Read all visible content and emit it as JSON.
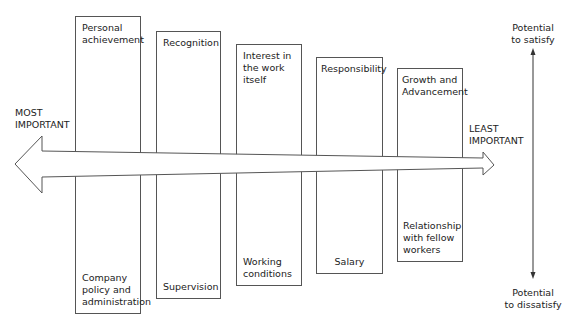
{
  "diagram": {
    "horizontal_axis": {
      "left_label": [
        "MOST",
        "IMPORTANT"
      ],
      "right_label": [
        "LEAST",
        "IMPORTANT"
      ]
    },
    "vertical_axis": {
      "top_label": [
        "Potential",
        "to satisfy"
      ],
      "bottom_label": [
        "Potential",
        "to dissatisfy"
      ]
    },
    "factors": [
      {
        "motivator": [
          "Personal",
          "achievement"
        ],
        "hygiene": [
          "Company",
          "policy and",
          "administration"
        ]
      },
      {
        "motivator": [
          "Recognition"
        ],
        "hygiene": [
          "Supervision"
        ]
      },
      {
        "motivator": [
          "Interest in",
          "the work",
          "itself"
        ],
        "hygiene": [
          "Working",
          "conditions"
        ]
      },
      {
        "motivator": [
          "Responsibility"
        ],
        "hygiene": [
          "Salary"
        ]
      },
      {
        "motivator": [
          "Growth and",
          "Advancement"
        ],
        "hygiene": [
          "Relationship",
          "with fellow",
          "workers"
        ]
      }
    ],
    "colors": {
      "line": "#555555",
      "text": "#222222",
      "background": "#ffffff"
    }
  }
}
